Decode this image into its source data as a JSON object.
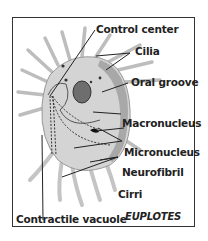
{
  "diagram": {
    "title": "EUPLOTES",
    "labels": {
      "control_center": "Control center",
      "cilia": "Cilia",
      "oral_groove": "Oral groove",
      "macronucleus": "Macronucleus",
      "micronucleus": "Micronucleus",
      "neurofibril": "Neurofibril",
      "cirri": "Cirri",
      "contractile_vacuole": "Contractile vacuole"
    },
    "colors": {
      "body": "#d4d4d4",
      "body_dark": "#9a9a9a",
      "cilia": "#c8c8c8",
      "lines": "#222222"
    }
  }
}
